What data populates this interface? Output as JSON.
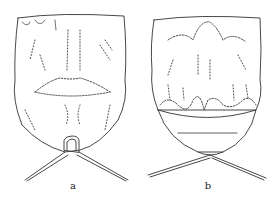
{
  "figure": {
    "panels": [
      {
        "id": "a",
        "label": "a",
        "description": "Dorsal view of specimen with lip-shaped central marking and paired spines from posterior tube"
      },
      {
        "id": "b",
        "label": "b",
        "description": "Dorsal view of specimen with rounded posterior shield and paired crossed spines"
      }
    ]
  },
  "colors": {
    "ink": "#333333",
    "background": "#ffffff"
  }
}
